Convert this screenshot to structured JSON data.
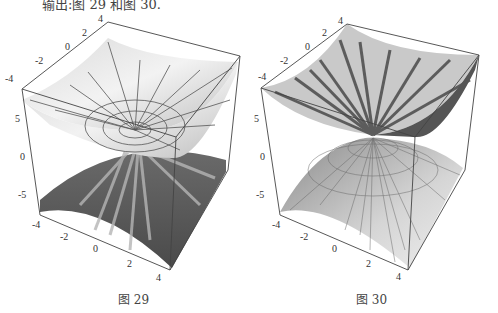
{
  "page": {
    "top_text": "输出:图 29 和图 30."
  },
  "figures": [
    {
      "id": "fig29",
      "caption": "图 29",
      "axes": {
        "back_axis_ticks": [
          "-4",
          "-2",
          "0",
          "2",
          "4"
        ],
        "vertical_axis_ticks": [
          "5",
          "0",
          "-5"
        ],
        "front_axis_ticks": [
          "-4",
          "-2",
          "0",
          "2",
          "4"
        ]
      },
      "description": "3D plot of two paraboloid sheets (upper bowl light gray with radial/circular mesh lines, lower dome dark with jagged shading)"
    },
    {
      "id": "fig30",
      "caption": "图 30",
      "axes": {
        "back_axis_ticks": [
          "-4",
          "-2",
          "0",
          "2",
          "4"
        ],
        "vertical_axis_ticks": [
          "5",
          "0",
          "-5"
        ],
        "front_axis_ticks": [
          "-4",
          "-2",
          "0",
          "2",
          "4"
        ]
      },
      "description": "3D plot of two paraboloid sheets (upper bowl with dark radial stripes, lower dome light with dense radial mesh lines)"
    }
  ]
}
